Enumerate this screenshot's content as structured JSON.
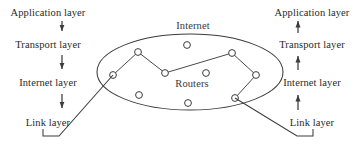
{
  "figure": {
    "stroke_color": "#3c3c3c",
    "text_color": "#2a2a2a",
    "background": "#ffffff"
  },
  "left_stack": {
    "name": "left-host-protocol-stack",
    "arrow_direction": "down",
    "layers": [
      {
        "label": "Application layer",
        "x": 48,
        "y": 7
      },
      {
        "label": "Transport layer",
        "x": 48,
        "y": 39
      },
      {
        "label": "Internet layer",
        "x": 48,
        "y": 77
      },
      {
        "label": "Link layer",
        "x": 48,
        "y": 117
      }
    ]
  },
  "right_stack": {
    "name": "right-host-protocol-stack",
    "arrow_direction": "up",
    "layers": [
      {
        "label": "Application layer",
        "x": 312,
        "y": 7
      },
      {
        "label": "Transport layer",
        "x": 312,
        "y": 39
      },
      {
        "label": "Internet layer",
        "x": 312,
        "y": 77
      },
      {
        "label": "Link layer",
        "x": 312,
        "y": 117
      }
    ]
  },
  "cloud": {
    "name": "internet-cloud",
    "title_label": "Internet",
    "title_x": 193,
    "title_y": 20,
    "inner_label": "Routers",
    "inner_label_x": 192,
    "inner_label_y": 78,
    "ellipse": {
      "cx": 190,
      "cy": 72,
      "rx": 93,
      "ry": 38
    },
    "routers": [
      {
        "id": "r1",
        "x": 113,
        "y": 75
      },
      {
        "id": "r2",
        "x": 138,
        "y": 52
      },
      {
        "id": "r3",
        "x": 187,
        "y": 45
      },
      {
        "id": "r4",
        "x": 165,
        "y": 73
      },
      {
        "id": "r5",
        "x": 206,
        "y": 73
      },
      {
        "id": "r6",
        "x": 232,
        "y": 53
      },
      {
        "id": "r7",
        "x": 256,
        "y": 75
      },
      {
        "id": "r8",
        "x": 235,
        "y": 98
      },
      {
        "id": "r9",
        "x": 139,
        "y": 95
      },
      {
        "id": "r10",
        "x": 188,
        "y": 103
      }
    ],
    "links": [
      {
        "from": "r1",
        "to": "r2"
      },
      {
        "from": "r2",
        "to": "r4"
      },
      {
        "from": "r4",
        "to": "r6"
      },
      {
        "from": "r6",
        "to": "r7"
      },
      {
        "from": "r7",
        "to": "r8"
      }
    ],
    "node_radius": 3.4
  },
  "connectors": {
    "left": {
      "name": "left-link-layer-to-cloud",
      "points": "43,129 43,136 59,136 113,75"
    },
    "right": {
      "name": "right-link-layer-to-cloud",
      "points": "235,98 297,136 313,136 313,129"
    }
  }
}
